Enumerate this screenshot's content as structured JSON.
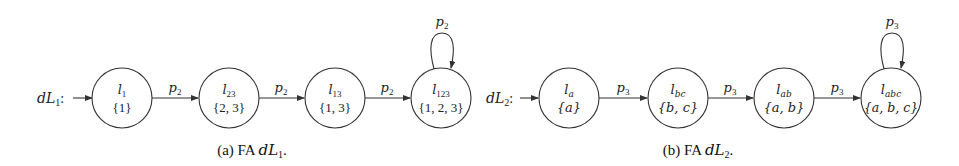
{
  "figures": [
    {
      "id": "a",
      "automaton_name": "dL",
      "automaton_sub": "1",
      "caption_prefix": "(a) FA ",
      "caption_var": "dL",
      "caption_sub": "1",
      "caption_suffix": ".",
      "states": [
        {
          "name": "l",
          "sub": "1",
          "set": "{1}"
        },
        {
          "name": "l",
          "sub": "23",
          "set": "{2, 3}"
        },
        {
          "name": "l",
          "sub": "13",
          "set": "{1, 3}"
        },
        {
          "name": "l",
          "sub": "123",
          "set": "{1, 2, 3}"
        }
      ],
      "transitions": [
        {
          "label": "p",
          "sub": "2"
        },
        {
          "label": "p",
          "sub": "2"
        },
        {
          "label": "p",
          "sub": "2"
        }
      ],
      "self_loop": {
        "label": "p",
        "sub": "2"
      }
    },
    {
      "id": "b",
      "automaton_name": "dL",
      "automaton_sub": "2",
      "caption_prefix": "(b) FA ",
      "caption_var": "dL",
      "caption_sub": "2",
      "caption_suffix": ".",
      "states": [
        {
          "name": "l",
          "sub": "a",
          "set": "{a}"
        },
        {
          "name": "l",
          "sub": "bc",
          "set": "{b, c}"
        },
        {
          "name": "l",
          "sub": "ab",
          "set": "{a, b}"
        },
        {
          "name": "l",
          "sub": "abc",
          "set": "{a, b, c}"
        }
      ],
      "transitions": [
        {
          "label": "p",
          "sub": "3"
        },
        {
          "label": "p",
          "sub": "3"
        },
        {
          "label": "p",
          "sub": "3"
        }
      ],
      "self_loop": {
        "label": "p",
        "sub": "3"
      }
    }
  ],
  "colors": {
    "stroke": "#333333",
    "text": "#222222",
    "background": "#ffffff"
  }
}
